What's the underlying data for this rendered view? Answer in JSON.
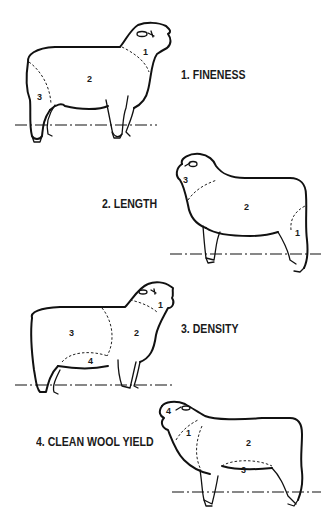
{
  "diagram": {
    "panels": [
      {
        "id": "fineness",
        "caption": "1. FINENESS",
        "facing": "right",
        "regions": [
          {
            "label": "1",
            "area": "neck"
          },
          {
            "label": "2",
            "area": "body"
          },
          {
            "label": "3",
            "area": "britch"
          }
        ]
      },
      {
        "id": "length",
        "caption": "2. LENGTH",
        "facing": "left",
        "regions": [
          {
            "label": "3",
            "area": "neck"
          },
          {
            "label": "2",
            "area": "body"
          },
          {
            "label": "1",
            "area": "britch"
          }
        ]
      },
      {
        "id": "density",
        "caption": "3. DENSITY",
        "facing": "right",
        "regions": [
          {
            "label": "1",
            "area": "neck"
          },
          {
            "label": "2",
            "area": "shoulder"
          },
          {
            "label": "3",
            "area": "back-body"
          },
          {
            "label": "4",
            "area": "belly"
          }
        ]
      },
      {
        "id": "clean-wool-yield",
        "caption": "4. CLEAN WOOL YIELD",
        "facing": "left",
        "regions": [
          {
            "label": "4",
            "area": "head"
          },
          {
            "label": "1",
            "area": "neck-shoulder"
          },
          {
            "label": "2",
            "area": "body"
          },
          {
            "label": "3",
            "area": "belly"
          }
        ]
      }
    ]
  },
  "colors": {
    "line": "#111111",
    "background": "#ffffff"
  }
}
